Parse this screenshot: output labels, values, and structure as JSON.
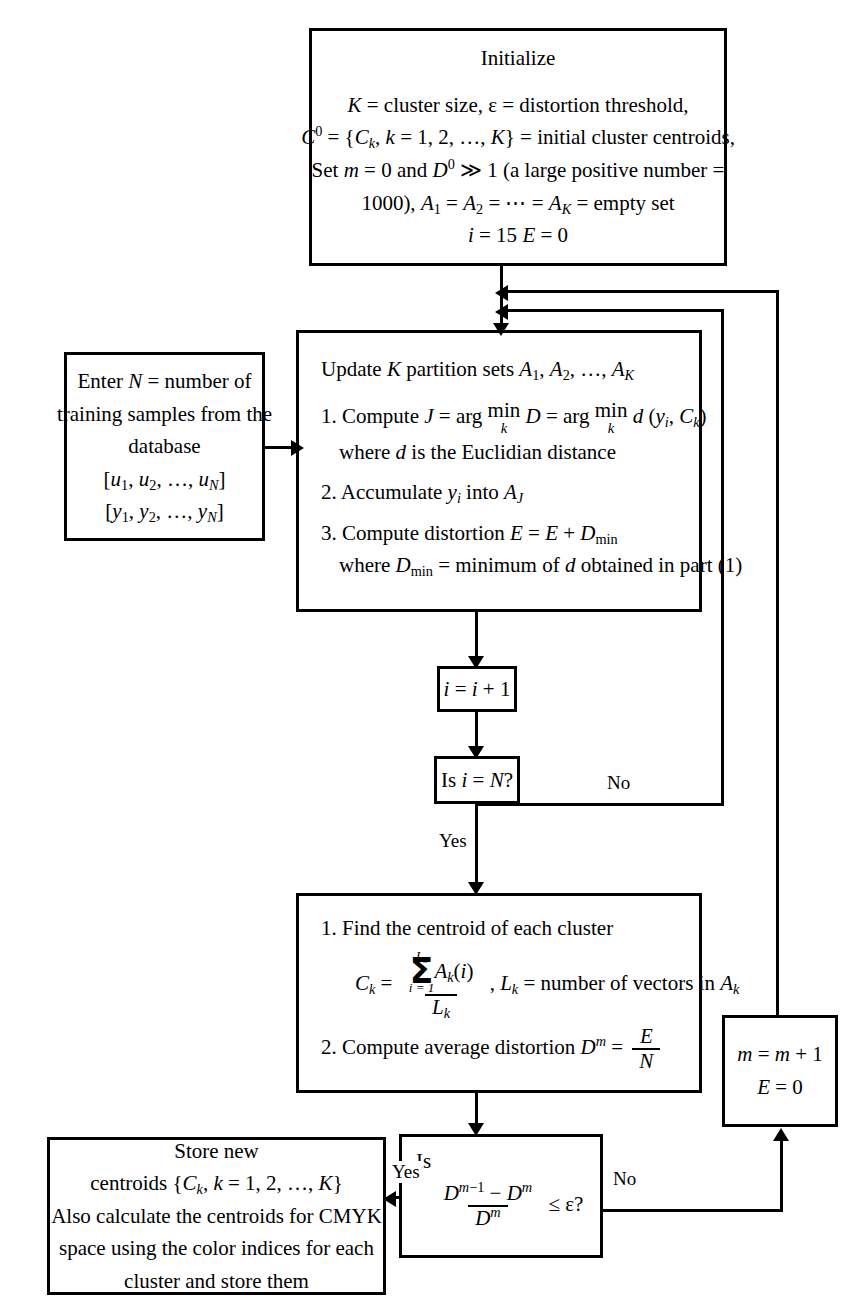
{
  "diagram": {
    "stroke_color": "#000000",
    "background_color": "#ffffff"
  },
  "nodes": {
    "initialize": {
      "heading": "Initialize",
      "line1_a": "K",
      "line1_b": " = cluster size, ",
      "line1_c": "ε",
      "line1_d": " = distortion threshold,",
      "line2": "C⁰ = {C_k, k = 1, 2, …, K} = initial cluster centroids,",
      "line3": "Set m = 0 and D⁰ ≫ 1 (a large positive number =",
      "line4": "1000), A₁ = A₂ = ⋯ = A_K = empty set",
      "line5": "i = 15 E = 0",
      "plain_text": "Initialize. K = cluster size, ε = distortion threshold, C^0 = {C_k, k = 1, 2, ..., K} = initial cluster centroids, Set m = 0 and D^0 >> 1 (a large positive number = 1000), A_1 = A_2 = ... = A_K = empty set, i = 15 E = 0"
    },
    "enter_n": {
      "line1": "Enter N = number of",
      "line2": "training samples from the",
      "line3": "database",
      "line4": "[u₁, u₂, …, u_N]",
      "line5": "[y₁, y₂, …, y_N]",
      "plain_text": "Enter N = number of training samples from the database [u_1, u_2, ..., u_N] [y_1, y_2, ..., y_N]"
    },
    "update": {
      "heading": "Update K partition sets A₁, A₂, …, A_K",
      "step1": "1. Compute J = arg min D = arg min d (y_i, C_k)",
      "step1_sub": "k",
      "step1_note": "where d is the Euclidian distance",
      "step2": "2. Accumulate y_i into A_J",
      "step3": "3. Compute distortion E = E + D_min",
      "step3_note": "where D_min = minimum of d obtained in part (1)",
      "plain_text": "Update K partition sets A_1, A_2, ..., A_K. 1. Compute J = arg min_k D = arg min_k d(y_i, C_k) where d is the Euclidian distance. 2. Accumulate y_i into A_J. 3. Compute distortion E = E + D_min where D_min = minimum of d obtained in part (1)"
    },
    "increment_i": {
      "text": "i = i + 1",
      "plain_text": "i = i + 1"
    },
    "is_i_eq_n": {
      "text": "Is i = N?",
      "plain_text": "Is i = N?"
    },
    "centroid": {
      "step1": "1. Find the centroid of each cluster",
      "formula_lhs": "C_k =",
      "formula_num_sum_top": "L_k",
      "formula_num_sum_bot": "i = 1",
      "formula_num_body": "A_k(i)",
      "formula_den": "L_k",
      "formula_tail": ", L_k = number of vectors in A_k",
      "step2": "2. Compute average distortion D^m =",
      "step2_frac_num": "E",
      "step2_frac_den": "N",
      "plain_text": "1. Find the centroid of each cluster. C_k = (sum_{i=1}^{L_k} A_k(i)) / L_k, L_k = number of vectors in A_k. 2. Compute average distortion D^m = E / N"
    },
    "convergence_test": {
      "lead": "Is",
      "frac_num": "D^{m−1} − D^m",
      "frac_den": "D^m",
      "tail": "≤ ε?",
      "plain_text": "Is (D^{m-1} - D^m) / D^m <= epsilon ?"
    },
    "increment_m": {
      "line1": "m = m + 1",
      "line2": "E = 0",
      "plain_text": "m = m + 1, E = 0"
    },
    "store": {
      "line1": "Store new",
      "line2": "centroids {C_k, k = 1, 2, …, K}",
      "line3": "Also calculate the centroids for CMYK",
      "line4": "space using the color indices for each",
      "line5": "cluster and store them",
      "plain_text": "Store new centroids {C_k, k = 1, 2, ..., K}. Also calculate the centroids for CMYK space using the color indices for each cluster and store them"
    }
  },
  "edge_labels": {
    "yes_i_loop": "Yes",
    "no_i_loop": "No",
    "yes_converged": "Yes",
    "no_converged": "No"
  }
}
